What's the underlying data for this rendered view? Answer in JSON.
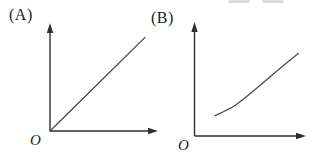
{
  "figure": {
    "background": "#ffffff",
    "axis_color": "#2f2f2f",
    "series_color": "#4a4a4a",
    "label_color": "#1b1b1b"
  },
  "chart_data": [
    {
      "type": "line",
      "title": "(A)",
      "origin_label": "O",
      "xlabel": "",
      "ylabel": "",
      "shape": "straight line through the origin, slope about 1",
      "x": [
        0,
        0.88
      ],
      "y": [
        0,
        0.9
      ],
      "axis": {
        "x_range": [
          0,
          1
        ],
        "y_range": [
          0,
          1
        ],
        "ticks": false,
        "grid": false,
        "arrows": true,
        "legend": false
      }
    },
    {
      "type": "line",
      "title": "(B)",
      "origin_label": "O",
      "xlabel": "",
      "ylabel": "",
      "shape": "concave-up increasing curve starting above the origin",
      "x": [
        0.18,
        0.36,
        0.54,
        0.72,
        0.93
      ],
      "y": [
        0.18,
        0.27,
        0.41,
        0.56,
        0.73
      ],
      "axis": {
        "x_range": [
          0,
          1
        ],
        "y_range": [
          0,
          1
        ],
        "ticks": false,
        "grid": false,
        "arrows": true,
        "legend": false
      }
    }
  ]
}
